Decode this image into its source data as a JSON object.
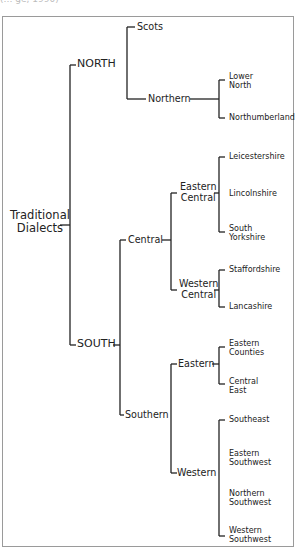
{
  "caption_fragment": "(… ge, 1990)",
  "tree": {
    "root": {
      "line1": "Traditional",
      "line2": "Dialects"
    },
    "north": "NORTH",
    "south": "SOUTH",
    "scots": "Scots",
    "northern": "Northern",
    "lower_north": {
      "line1": "Lower",
      "line2": "North"
    },
    "northumberland": "Northumberland",
    "central": "Central",
    "eastern_central": {
      "line1": "Eastern",
      "line2": "Central"
    },
    "leicestershire": "Leicestershire",
    "lincolnshire": "Lincolnshire",
    "south_yorkshire": {
      "line1": "South",
      "line2": "Yorkshire"
    },
    "western_central": {
      "line1": "Western",
      "line2": "Central"
    },
    "staffordshire": "Staffordshire",
    "lancashire": "Lancashire",
    "southern": "Southern",
    "eastern": "Eastern",
    "eastern_counties": {
      "line1": "Eastern",
      "line2": "Counties"
    },
    "central_east": {
      "line1": "Central",
      "line2": "East"
    },
    "western": "Western",
    "southeast": "Southeast",
    "eastern_southwest": {
      "line1": "Eastern",
      "line2": "Southwest"
    },
    "northern_southwest": {
      "line1": "Northern",
      "line2": "Southwest"
    },
    "western_southwest": {
      "line1": "Western",
      "line2": "Southwest"
    }
  }
}
